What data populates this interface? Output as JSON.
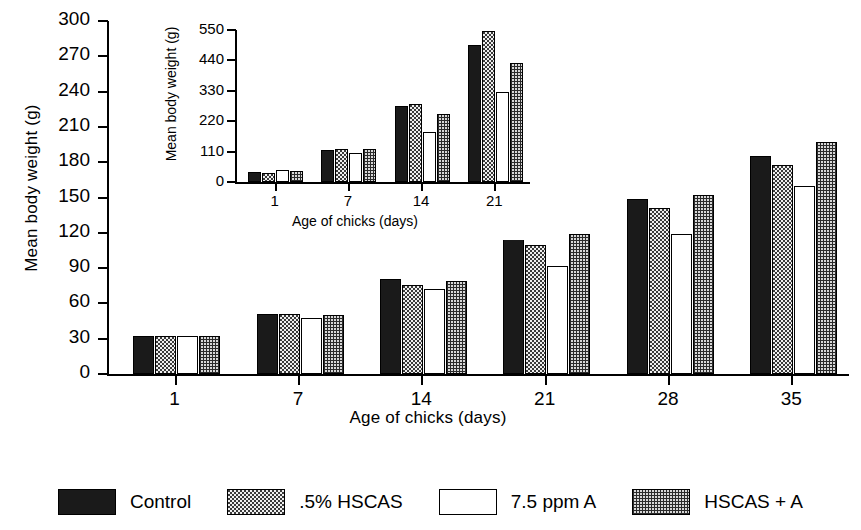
{
  "chart_data": {
    "type": "bar",
    "title": "",
    "xlabel": "Age of chicks (days)",
    "ylabel": "Mean body weight (g)",
    "categories": [
      "1",
      "7",
      "14",
      "21",
      "28",
      "35"
    ],
    "ylim": [
      0,
      300
    ],
    "yticks": [
      "0",
      "30",
      "60",
      "90",
      "120",
      "150",
      "180",
      "210",
      "240",
      "270",
      "300"
    ],
    "grid": false,
    "legend_position": "bottom",
    "series": [
      {
        "name": "Control",
        "pattern": "solid",
        "values": [
          32,
          51,
          81,
          115,
          149,
          185
        ]
      },
      {
        "name": ".5% HSCAS",
        "pattern": "light",
        "values": [
          32,
          51,
          76,
          110,
          141,
          178
        ]
      },
      {
        "name": "7.5 ppm A",
        "pattern": "white",
        "values": [
          32,
          48,
          72,
          92,
          119,
          160
        ]
      },
      {
        "name": "HSCAS + A",
        "pattern": "dark",
        "values": [
          32,
          50,
          79,
          119,
          152,
          197
        ]
      }
    ],
    "inset": {
      "type": "bar",
      "xlabel": "Age of chicks (days)",
      "ylabel": "Mean body weight (g)",
      "categories": [
        "1",
        "7",
        "14",
        "21"
      ],
      "ylim": [
        0,
        550
      ],
      "yticks": [
        "0",
        "110",
        "220",
        "330",
        "440",
        "550"
      ],
      "grid": false,
      "series": [
        {
          "name": "Control",
          "pattern": "solid",
          "values": [
            38,
            115,
            275,
            495
          ]
        },
        {
          "name": ".5% HSCAS",
          "pattern": "light",
          "values": [
            33,
            118,
            283,
            545
          ]
        },
        {
          "name": "7.5 ppm A",
          "pattern": "white",
          "values": [
            42,
            105,
            180,
            325
          ]
        },
        {
          "name": "HSCAS + A",
          "pattern": "dark",
          "values": [
            41,
            118,
            245,
            432
          ]
        }
      ]
    }
  },
  "legend": {
    "items": [
      {
        "label": "Control",
        "pattern": "solid"
      },
      {
        "label": ".5% HSCAS",
        "pattern": "light"
      },
      {
        "label": "7.5 ppm A",
        "pattern": "white"
      },
      {
        "label": "HSCAS + A",
        "pattern": "dark"
      }
    ]
  }
}
